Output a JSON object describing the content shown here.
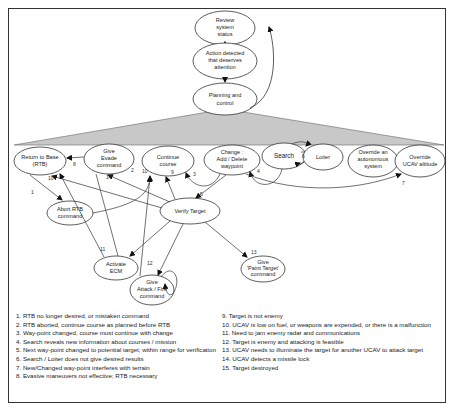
{
  "diagram": {
    "nodes": {
      "review": [
        "Review",
        "system",
        "status"
      ],
      "action": [
        "Action detected",
        "that deserves",
        "attention"
      ],
      "planning": [
        "Planning and",
        "control"
      ],
      "rtb": [
        "Return to Base",
        "(RTB)"
      ],
      "evade": [
        "Give",
        "Evade",
        "command"
      ],
      "continue": [
        "Continue",
        "course"
      ],
      "change": [
        "Change :",
        "Add / Delete",
        "waypoint"
      ],
      "search": [
        "Search"
      ],
      "loiter": [
        "Loiter"
      ],
      "override_auto": [
        "Override an",
        "autonomous",
        "system"
      ],
      "override_alt": [
        "Override",
        "UCAV altitude"
      ],
      "abort_rtb": [
        "Abort RTB",
        "command"
      ],
      "verify": [
        "Verify Target"
      ],
      "ecm": [
        "Activate",
        "ECM"
      ],
      "attack": [
        "Give",
        "Attack / Fire",
        "command"
      ],
      "paint": [
        "Give",
        "'Paint Target'",
        "command"
      ]
    },
    "edge_labels": {
      "e1": "1",
      "e2": "2",
      "e3": "3",
      "e4": "4",
      "e5": "5",
      "e6": "6",
      "e7": "7",
      "e8": "8",
      "e9": "9",
      "e10a": "10",
      "e10b": "10",
      "e11": "11",
      "e12": "12",
      "e13": "13",
      "e14": "14"
    },
    "colors": {
      "fan": "#c8c8c8",
      "line": "#333333",
      "frame": "#333333"
    }
  },
  "legend": {
    "left": [
      "1.  RTB no longer desired, or mistaken command",
      "2.  RTB aborted, continue course as planned before RTB",
      "3.  Way-point changed, course must continue with change",
      "4.  Search reveals new information about courses / mission",
      "5.  Next way-point changed to potential target; within range for verification",
      "6.  Search / Loiter does not give desired results",
      "7.   New/Changed way-point interferes with terrain",
      "8. Evasive maneuvers not effective; RTB necessary"
    ],
    "right": [
      "9. Target is not enemy",
      "10. UCAV is low on fuel, or weapons are expended, or there is a malfunction",
      "11. Need to jam enemy radar and communications",
      "12. Target is enemy and attacking is feasible",
      "13. UCAV needs to illuminate the target for another UCAV to attack target",
      "14. UCAV detects a missile lock",
      "15. Target destroyed"
    ]
  }
}
